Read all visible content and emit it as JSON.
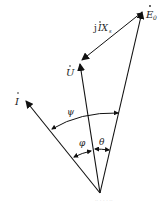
{
  "diagram": {
    "type": "phasor-diagram",
    "origin": {
      "x": 100,
      "y": 193
    },
    "phasors": [
      {
        "id": "E0",
        "label": "E",
        "subscript": "0",
        "dot": true,
        "tip": {
          "x": 143,
          "y": 10
        }
      },
      {
        "id": "U",
        "label": "U",
        "subscript": "",
        "dot": true,
        "tip": {
          "x": 79,
          "y": 62
        }
      },
      {
        "id": "I",
        "label": "I",
        "subscript": "",
        "dot": true,
        "tip": {
          "x": 25,
          "y": 100
        }
      }
    ],
    "segment": {
      "label_prefix": "j",
      "label_main": "IX",
      "subscript": "s",
      "from": "E0",
      "to": "U"
    },
    "angles": [
      {
        "symbol": "ψ",
        "between": [
          "I",
          "E0"
        ]
      },
      {
        "symbol": "φ",
        "between": [
          "I",
          "U"
        ]
      },
      {
        "symbol": "θ",
        "between": [
          "U",
          "E0"
        ]
      }
    ],
    "watermark": "·· · ·  ·  ··"
  }
}
